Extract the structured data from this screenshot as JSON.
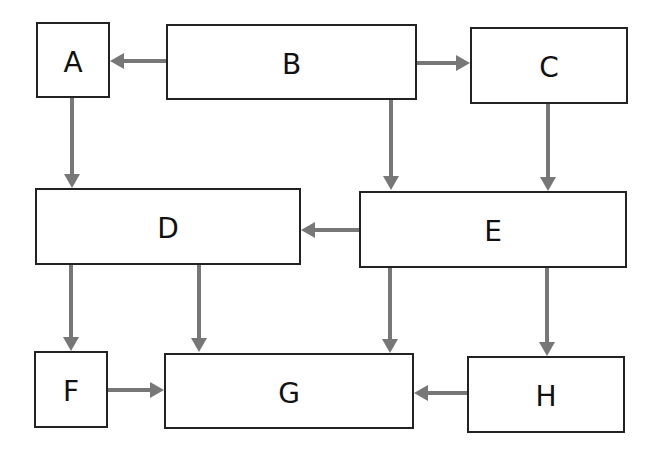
{
  "diagram": {
    "type": "flowchart",
    "colors": {
      "background": "#ffffff",
      "node_border": "#222222",
      "node_fill": "#ffffff",
      "label": "#111111",
      "arrow": "#777777"
    },
    "nodes": [
      {
        "id": "A",
        "label": "A",
        "x": 37,
        "y": 23,
        "w": 72,
        "h": 74
      },
      {
        "id": "B",
        "label": "B",
        "x": 167,
        "y": 25,
        "w": 249,
        "h": 74
      },
      {
        "id": "C",
        "label": "C",
        "x": 471,
        "y": 28,
        "w": 156,
        "h": 75
      },
      {
        "id": "D",
        "label": "D",
        "x": 36,
        "y": 189,
        "w": 264,
        "h": 75
      },
      {
        "id": "E",
        "label": "E",
        "x": 360,
        "y": 192,
        "w": 266,
        "h": 75
      },
      {
        "id": "F",
        "label": "F",
        "x": 35,
        "y": 352,
        "w": 72,
        "h": 75
      },
      {
        "id": "G",
        "label": "G",
        "x": 165,
        "y": 354,
        "w": 248,
        "h": 74
      },
      {
        "id": "H",
        "label": "H",
        "x": 468,
        "y": 357,
        "w": 156,
        "h": 75
      }
    ],
    "edges": [
      {
        "from": "B",
        "to": "A",
        "x1": 167,
        "y1": 61,
        "x2": 110,
        "y2": 61
      },
      {
        "from": "B",
        "to": "C",
        "x1": 416,
        "y1": 63,
        "x2": 470,
        "y2": 63
      },
      {
        "from": "A",
        "to": "D",
        "x1": 72,
        "y1": 97,
        "x2": 72,
        "y2": 188
      },
      {
        "from": "B",
        "to": "E",
        "x1": 391,
        "y1": 99,
        "x2": 391,
        "y2": 190
      },
      {
        "from": "C",
        "to": "E",
        "x1": 548,
        "y1": 103,
        "x2": 548,
        "y2": 191
      },
      {
        "from": "E",
        "to": "D",
        "x1": 360,
        "y1": 230,
        "x2": 301,
        "y2": 230
      },
      {
        "from": "D",
        "to": "F",
        "x1": 71,
        "y1": 264,
        "x2": 71,
        "y2": 351
      },
      {
        "from": "D",
        "to": "G",
        "x1": 199,
        "y1": 264,
        "x2": 199,
        "y2": 352
      },
      {
        "from": "E",
        "to": "G",
        "x1": 390,
        "y1": 267,
        "x2": 390,
        "y2": 353
      },
      {
        "from": "E",
        "to": "H",
        "x1": 547,
        "y1": 267,
        "x2": 547,
        "y2": 356
      },
      {
        "from": "F",
        "to": "G",
        "x1": 107,
        "y1": 390,
        "x2": 164,
        "y2": 390
      },
      {
        "from": "H",
        "to": "G",
        "x1": 468,
        "y1": 393,
        "x2": 414,
        "y2": 393
      }
    ]
  }
}
